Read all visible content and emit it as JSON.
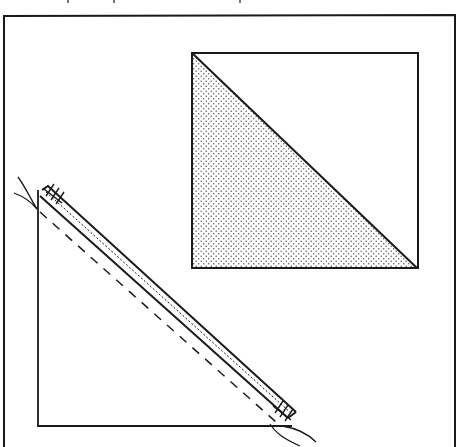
{
  "figure": {
    "colors": {
      "ink": "#1a1a1a",
      "paper": "#ffffff",
      "stipple": "#555555"
    },
    "parts": [
      {
        "id": "outer-frame",
        "description": "Outer border frame"
      },
      {
        "id": "finished-square",
        "description": "Square divided diagonally, lower-left half stippled"
      },
      {
        "id": "sewn-triangle",
        "description": "Right triangle with stitched diagonal strip, dashed seam line and thread tails"
      }
    ]
  }
}
